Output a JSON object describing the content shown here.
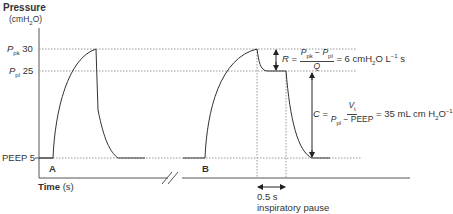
{
  "axis": {
    "y_title": "Pressure",
    "y_unit_prefix": "(cmH",
    "y_unit_sub": "2",
    "y_unit_suffix": "O)",
    "x_title": "Time",
    "x_unit": "(s)"
  },
  "levels": {
    "ppk_sym": "P",
    "ppk_sub": "pk",
    "ppk_val": "30",
    "ppl_sym": "P",
    "ppl_sub": "pl",
    "ppl_val": "25",
    "peep_label": "PEEP 5"
  },
  "markers": {
    "a": "A",
    "b": "B"
  },
  "resistance": {
    "lhs": "R",
    "eq": "=",
    "num_a": "P",
    "num_a_sub": "pk",
    "num_minus": " − ",
    "num_b": "P",
    "num_b_sub": "pl",
    "den": "Q",
    "result": "= 6 cmH",
    "result_sub": "2",
    "result_tail": "O L",
    "result_sup": "−1",
    "result_end": " s"
  },
  "compliance": {
    "lhs": "C",
    "eq": "=",
    "num": "V",
    "num_sub": "t",
    "den_a": "P",
    "den_a_sub": "pl",
    "den_b": " − PEEP",
    "result": "= 35 mL cm H",
    "result_sub": "2",
    "result_tail": "O",
    "result_sup": "−1"
  },
  "pause": {
    "duration": "0.5 s",
    "label": "inspiratory pause"
  },
  "colors": {
    "line": "#333333",
    "dotted": "#999999"
  }
}
